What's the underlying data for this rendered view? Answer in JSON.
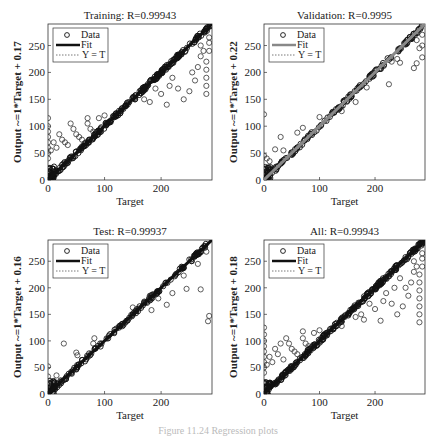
{
  "chart_data": [
    {
      "type": "scatter",
      "id": "training",
      "title": "Training: R=0.99943",
      "xlabel": "Target",
      "ylabel": "Output ~=1*Target + 0.17",
      "xlim": [
        0,
        290
      ],
      "ylim": [
        0,
        290
      ],
      "xticks": [
        0,
        100,
        200
      ],
      "yticks": [
        0,
        50,
        100,
        150,
        200,
        250
      ],
      "fit": {
        "slope": 1,
        "intercept": 0.17,
        "color": "#111111"
      },
      "legend": {
        "position": "top-left",
        "entries": [
          "Data",
          "Fit",
          "Y = T"
        ]
      },
      "outliers": [
        [
          0,
          115
        ],
        [
          0,
          100
        ],
        [
          0,
          90
        ],
        [
          0,
          80
        ],
        [
          0,
          70
        ],
        [
          0,
          60
        ],
        [
          0,
          50
        ],
        [
          0,
          40
        ],
        [
          5,
          55
        ],
        [
          10,
          70
        ],
        [
          15,
          60
        ],
        [
          20,
          85
        ],
        [
          25,
          75
        ],
        [
          30,
          70
        ],
        [
          35,
          65
        ],
        [
          40,
          105
        ],
        [
          45,
          95
        ],
        [
          50,
          85
        ],
        [
          55,
          80
        ],
        [
          60,
          75
        ],
        [
          70,
          115
        ],
        [
          70,
          105
        ],
        [
          75,
          95
        ],
        [
          80,
          90
        ],
        [
          90,
          115
        ],
        [
          100,
          120
        ],
        [
          170,
          150
        ],
        [
          180,
          145
        ],
        [
          190,
          170
        ],
        [
          200,
          160
        ],
        [
          210,
          140
        ],
        [
          215,
          175
        ],
        [
          220,
          190
        ],
        [
          230,
          170
        ],
        [
          240,
          150
        ],
        [
          250,
          165
        ],
        [
          255,
          200
        ],
        [
          260,
          185
        ],
        [
          265,
          210
        ],
        [
          270,
          230
        ],
        [
          280,
          160
        ],
        [
          280,
          175
        ],
        [
          280,
          190
        ],
        [
          280,
          205
        ],
        [
          280,
          220
        ],
        [
          285,
          240
        ],
        [
          285,
          255
        ],
        [
          285,
          265
        ],
        [
          275,
          240
        ],
        [
          270,
          250
        ]
      ]
    },
    {
      "type": "scatter",
      "id": "validation",
      "title": "Validation: R=0.9995",
      "xlabel": "Target",
      "ylabel": "Output ~=1*Target + 0.22",
      "xlim": [
        0,
        290
      ],
      "ylim": [
        0,
        290
      ],
      "xticks": [
        0,
        100,
        200
      ],
      "yticks": [
        0,
        50,
        100,
        150,
        200,
        250
      ],
      "fit": {
        "slope": 1,
        "intercept": 0.22,
        "color": "#888888"
      },
      "legend": {
        "position": "top-left",
        "entries": [
          "Data",
          "Fit",
          "Y = T"
        ]
      },
      "outliers": [
        [
          0,
          122
        ],
        [
          0,
          45
        ],
        [
          5,
          40
        ],
        [
          10,
          35
        ],
        [
          20,
          57
        ],
        [
          30,
          80
        ],
        [
          35,
          55
        ],
        [
          60,
          88
        ],
        [
          70,
          97
        ],
        [
          100,
          117
        ],
        [
          140,
          128
        ],
        [
          165,
          145
        ],
        [
          185,
          172
        ],
        [
          225,
          178
        ],
        [
          230,
          220
        ],
        [
          240,
          225
        ],
        [
          245,
          218
        ],
        [
          270,
          208
        ],
        [
          275,
          217
        ],
        [
          275,
          260
        ],
        [
          280,
          245
        ],
        [
          285,
          228
        ],
        [
          285,
          250
        ],
        [
          285,
          270
        ]
      ]
    },
    {
      "type": "scatter",
      "id": "test",
      "title": "Test: R=0.99937",
      "xlabel": "Target",
      "ylabel": "Output ~=1*Target + 0.16",
      "xlim": [
        0,
        290
      ],
      "ylim": [
        0,
        290
      ],
      "xticks": [
        0,
        100,
        200
      ],
      "yticks": [
        0,
        50,
        100,
        150,
        200,
        250
      ],
      "fit": {
        "slope": 1,
        "intercept": 0.16,
        "color": "#111111"
      },
      "legend": {
        "position": "top-left",
        "entries": [
          "Data",
          "Fit",
          "Y = T"
        ]
      },
      "outliers": [
        [
          0,
          52
        ],
        [
          0,
          33
        ],
        [
          0,
          18
        ],
        [
          15,
          35
        ],
        [
          28,
          95
        ],
        [
          50,
          78
        ],
        [
          52,
          73
        ],
        [
          80,
          95
        ],
        [
          82,
          105
        ],
        [
          150,
          163
        ],
        [
          180,
          185
        ],
        [
          183,
          158
        ],
        [
          195,
          180
        ],
        [
          210,
          168
        ],
        [
          220,
          190
        ],
        [
          240,
          223
        ],
        [
          245,
          198
        ],
        [
          265,
          245
        ],
        [
          270,
          197
        ],
        [
          280,
          268
        ],
        [
          283,
          137
        ],
        [
          285,
          147
        ]
      ]
    },
    {
      "type": "scatter",
      "id": "all",
      "title": "All: R=0.99943",
      "xlabel": "Target",
      "ylabel": "Output ~=1*Target + 0.18",
      "xlim": [
        0,
        290
      ],
      "ylim": [
        0,
        290
      ],
      "xticks": [
        0,
        100,
        200
      ],
      "yticks": [
        0,
        50,
        100,
        150,
        200,
        250
      ],
      "fit": {
        "slope": 1,
        "intercept": 0.18,
        "color": "#111111"
      },
      "legend": {
        "position": "top-left",
        "entries": [
          "Data",
          "Fit",
          "Y = T"
        ]
      },
      "outliers": [
        [
          0,
          125
        ],
        [
          0,
          112
        ],
        [
          0,
          100
        ],
        [
          0,
          90
        ],
        [
          0,
          80
        ],
        [
          0,
          70
        ],
        [
          0,
          60
        ],
        [
          0,
          50
        ],
        [
          0,
          40
        ],
        [
          5,
          55
        ],
        [
          10,
          70
        ],
        [
          15,
          60
        ],
        [
          20,
          85
        ],
        [
          25,
          75
        ],
        [
          30,
          95
        ],
        [
          35,
          65
        ],
        [
          40,
          105
        ],
        [
          45,
          95
        ],
        [
          50,
          85
        ],
        [
          55,
          80
        ],
        [
          60,
          75
        ],
        [
          70,
          118
        ],
        [
          70,
          105
        ],
        [
          75,
          95
        ],
        [
          80,
          90
        ],
        [
          90,
          115
        ],
        [
          100,
          120
        ],
        [
          140,
          128
        ],
        [
          165,
          145
        ],
        [
          175,
          150
        ],
        [
          180,
          140
        ],
        [
          190,
          170
        ],
        [
          200,
          160
        ],
        [
          210,
          138
        ],
        [
          215,
          175
        ],
        [
          220,
          190
        ],
        [
          230,
          170
        ],
        [
          240,
          150
        ],
        [
          250,
          165
        ],
        [
          255,
          200
        ],
        [
          260,
          185
        ],
        [
          265,
          210
        ],
        [
          270,
          230
        ],
        [
          280,
          135
        ],
        [
          280,
          150
        ],
        [
          280,
          165
        ],
        [
          280,
          180
        ],
        [
          280,
          195
        ],
        [
          280,
          210
        ],
        [
          280,
          225
        ],
        [
          285,
          240
        ],
        [
          285,
          255
        ],
        [
          285,
          265
        ],
        [
          275,
          240
        ],
        [
          270,
          250
        ],
        [
          245,
          218
        ],
        [
          235,
          200
        ]
      ]
    }
  ],
  "caption": "Figure 11.24  Regression plots"
}
